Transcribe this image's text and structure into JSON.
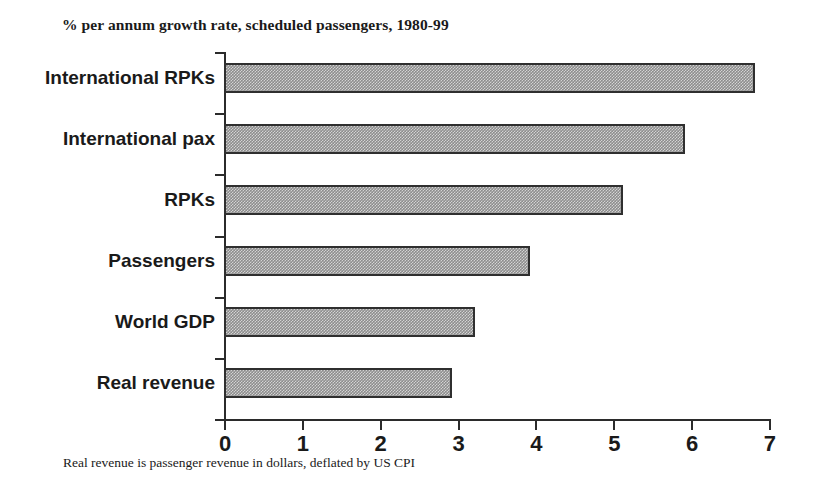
{
  "chart_data": {
    "type": "bar",
    "orientation": "horizontal",
    "title": "% per annum growth rate, scheduled passengers, 1980-99",
    "subtitle": "",
    "xlabel": "",
    "ylabel": "",
    "categories": [
      "International RPKs",
      "International pax",
      "RPKs",
      "Passengers",
      "World GDP",
      "Real revenue"
    ],
    "values": [
      6.8,
      5.9,
      5.1,
      3.9,
      3.2,
      2.9
    ],
    "xlim": [
      0,
      7
    ],
    "xticks": [
      0,
      1,
      2,
      3,
      4,
      5,
      6,
      7
    ],
    "xtick_labels": [
      "0",
      "1",
      "2",
      "3",
      "4",
      "5",
      "6",
      "7"
    ],
    "grid": false,
    "legend": false,
    "legend_position": "none",
    "annotations": [
      "Real revenue is passenger revenue in dollars, deflated by US CPI"
    ],
    "bar_fill_color": "#8d8d8d",
    "bar_edge_color": "#2f2f2f",
    "axis_color": "#2b2b2b",
    "background_color": "#ffffff"
  },
  "footnote": {
    "text": "Real revenue is passenger revenue in dollars, deflated by US CPI"
  }
}
